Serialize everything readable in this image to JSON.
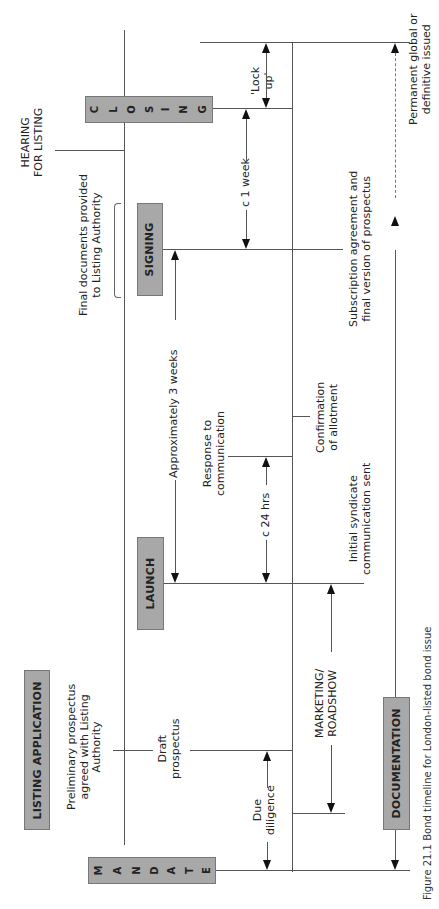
{
  "diagram": {
    "orientation": "rotated-90-ccw",
    "stages": {
      "mandate": "MANDATE",
      "listing_application": "LISTING APPLICATION",
      "launch": "LAUNCH",
      "signing": "SIGNING",
      "closing": "CLOSING",
      "documentation": "DOCUMENTATION",
      "hearing_line1": "HEARING",
      "hearing_line2": "FOR LISTING"
    },
    "mandate_letters": [
      "M",
      "A",
      "N",
      "D",
      "A",
      "T",
      "E"
    ],
    "closing_letters": [
      "C",
      "L",
      "O",
      "S",
      "I",
      "N",
      "G"
    ],
    "labels": {
      "preliminary_l1": "Preliminary prospectus",
      "preliminary_l2": "agreed with Listing",
      "preliminary_l3": "Authority",
      "draft_l1": "Draft",
      "draft_l2": "prospectus",
      "due_l1": "Due",
      "due_l2": "diligence",
      "marketing_l1": "MARKETING/",
      "marketing_l2": "ROADSHOW",
      "approx_3_weeks": "Approximately 3 weeks",
      "response_l1": "Response to",
      "response_l2": "communication",
      "c24hrs": "c 24 hrs",
      "confirmation_l1": "Confirmation",
      "confirmation_l2": "of allotment",
      "initial_l1": "Initial syndicate",
      "initial_l2": "communication sent",
      "final_docs_l1": "Final documents provided",
      "final_docs_l2": "to Listing Authority",
      "c1week": "c 1 week",
      "subscription_l1": "Subscription agreement and",
      "subscription_l2": "final version of prospectus",
      "lockup_l1": "'Lock",
      "lockup_l2": "up'",
      "permanent_l1": "Permanent global or",
      "permanent_l2": "definitive issued"
    },
    "caption": "Figure 21.1 Bond timeline for London-listed bond issue"
  }
}
